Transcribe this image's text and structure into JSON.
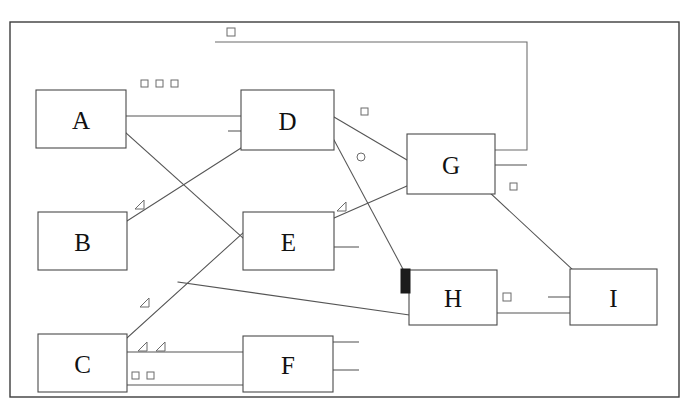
{
  "diagram": {
    "type": "node-link-block-diagram",
    "background_color": "#ffffff",
    "line_color": "#555555",
    "frame_color": "#3d3d3d",
    "marker_fill_color": "#1b1b1b",
    "frame": {
      "x": 10,
      "y": 22,
      "width": 669,
      "height": 375
    },
    "nodes": [
      {
        "id": "A",
        "label": "A",
        "x": 36,
        "y": 90,
        "width": 90,
        "height": 58
      },
      {
        "id": "B",
        "label": "B",
        "x": 38,
        "y": 212,
        "width": 89,
        "height": 58
      },
      {
        "id": "C",
        "label": "C",
        "x": 38,
        "y": 334,
        "width": 89,
        "height": 58
      },
      {
        "id": "D",
        "label": "D",
        "x": 241,
        "y": 90,
        "width": 93,
        "height": 60
      },
      {
        "id": "E",
        "label": "E",
        "x": 243,
        "y": 212,
        "width": 91,
        "height": 58
      },
      {
        "id": "F",
        "label": "F",
        "x": 243,
        "y": 336,
        "width": 90,
        "height": 56
      },
      {
        "id": "G",
        "label": "G",
        "x": 407,
        "y": 134,
        "width": 88,
        "height": 60
      },
      {
        "id": "H",
        "label": "H",
        "x": 409,
        "y": 270,
        "width": 88,
        "height": 55
      },
      {
        "id": "I",
        "label": "I",
        "x": 570,
        "y": 269,
        "width": 87,
        "height": 56
      }
    ],
    "edges": [
      {
        "id": "a-d-horizontal",
        "from": "A",
        "to": "D",
        "points": "126,116 241,116"
      },
      {
        "id": "a-e-diagonal",
        "from": "A",
        "to": "E",
        "points": "126,133 243,238"
      },
      {
        "id": "b-d-diagonal",
        "from": "B",
        "to": "D",
        "points": "127,221 241,148"
      },
      {
        "id": "c-e-diagonal",
        "from": "C",
        "to": "E",
        "points": "127,338 244,232"
      },
      {
        "id": "c-h-long",
        "from": "C",
        "to": "H",
        "points": "178,282 409,315"
      },
      {
        "id": "c-f-upper",
        "from": "C",
        "to": "F",
        "points": "127,352 243,352"
      },
      {
        "id": "c-f-lower",
        "from": "C",
        "to": "F",
        "points": "127,385 243,385"
      },
      {
        "id": "d-g-diagonal",
        "from": "D",
        "to": "G",
        "points": "334,117 407,160"
      },
      {
        "id": "d-h-diagonal",
        "from": "D",
        "to": "H",
        "points": "334,140 404,271"
      },
      {
        "id": "e-g-diagonal",
        "from": "E",
        "to": "G",
        "points": "334,218 407,186"
      },
      {
        "id": "g-i-diagonal",
        "from": "G",
        "to": "I",
        "points": "489,192 573,270"
      },
      {
        "id": "h-i-horizontal",
        "from": "H",
        "to": "I",
        "points": "497,313 570,313"
      }
    ],
    "brackets": [
      {
        "id": "top-bracket-d-g",
        "path": "M215,42 L527,42 L527,150 L495,150"
      }
    ],
    "stubs": [
      {
        "id": "stub-d-left",
        "points": "228,131 241,131"
      },
      {
        "id": "stub-e-right",
        "points": "334,247 359,247"
      },
      {
        "id": "stub-g-right",
        "points": "495,165 527,165"
      },
      {
        "id": "stub-f-right-upper",
        "points": "333,342 359,342"
      },
      {
        "id": "stub-f-right-lower",
        "points": "333,370 359,370"
      },
      {
        "id": "stub-i-left",
        "points": "548,297 570,297"
      }
    ],
    "markers": [
      {
        "id": "sq-top",
        "shape": "square",
        "x": 227,
        "y": 28,
        "size": 8,
        "filled": false
      },
      {
        "id": "sq-a-1",
        "shape": "square",
        "x": 141,
        "y": 80,
        "size": 7,
        "filled": false
      },
      {
        "id": "sq-a-2",
        "shape": "square",
        "x": 156,
        "y": 80,
        "size": 7,
        "filled": false
      },
      {
        "id": "sq-a-3",
        "shape": "square",
        "x": 171,
        "y": 80,
        "size": 7,
        "filled": false
      },
      {
        "id": "sq-d-right",
        "shape": "square",
        "x": 361,
        "y": 108,
        "size": 7,
        "filled": false
      },
      {
        "id": "circle-d-e",
        "shape": "circle",
        "x": 357,
        "y": 153,
        "size": 8,
        "filled": false
      },
      {
        "id": "sq-g-below",
        "shape": "square",
        "x": 510,
        "y": 183,
        "size": 7,
        "filled": false
      },
      {
        "id": "sq-h-i",
        "shape": "square",
        "x": 503,
        "y": 293,
        "size": 8,
        "filled": false
      },
      {
        "id": "sq-c-1",
        "shape": "square",
        "x": 132,
        "y": 372,
        "size": 7,
        "filled": false
      },
      {
        "id": "sq-c-2",
        "shape": "square",
        "x": 147,
        "y": 372,
        "size": 7,
        "filled": false
      },
      {
        "id": "sq-h-left",
        "shape": "square",
        "x": 401,
        "y": 269,
        "size": 8,
        "width": 9,
        "height": 24,
        "filled": true
      }
    ],
    "triangles": [
      {
        "id": "tri-b-above",
        "x": 135,
        "y": 200,
        "size": 9
      },
      {
        "id": "tri-e-above",
        "x": 337,
        "y": 202,
        "size": 9
      },
      {
        "id": "tri-c-mid",
        "x": 140,
        "y": 298,
        "size": 9
      },
      {
        "id": "tri-c-1",
        "x": 138,
        "y": 342,
        "size": 9
      },
      {
        "id": "tri-c-2",
        "x": 156,
        "y": 342,
        "size": 9
      }
    ]
  }
}
